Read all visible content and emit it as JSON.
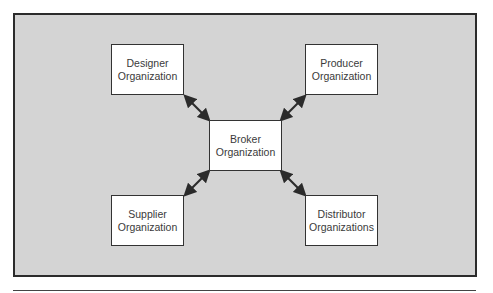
{
  "diagram": {
    "nodes": [
      {
        "id": "designer",
        "line1": "Designer",
        "line2": "Organization"
      },
      {
        "id": "producer",
        "line1": "Producer",
        "line2": "Organization"
      },
      {
        "id": "broker",
        "line1": "Broker",
        "line2": "Organization"
      },
      {
        "id": "supplier",
        "line1": "Supplier",
        "line2": "Organization"
      },
      {
        "id": "distributor",
        "line1": "Distributor",
        "line2": "Organizations"
      }
    ],
    "edges": [
      {
        "from": "designer",
        "to": "broker",
        "type": "bidirectional"
      },
      {
        "from": "producer",
        "to": "broker",
        "type": "bidirectional"
      },
      {
        "from": "supplier",
        "to": "broker",
        "type": "bidirectional"
      },
      {
        "from": "distributor",
        "to": "broker",
        "type": "bidirectional"
      }
    ],
    "colors": {
      "background": "#d4d4d4",
      "frame_border": "#2b2b2b",
      "node_fill": "#ffffff",
      "arrow": "#2b2b2b"
    }
  }
}
